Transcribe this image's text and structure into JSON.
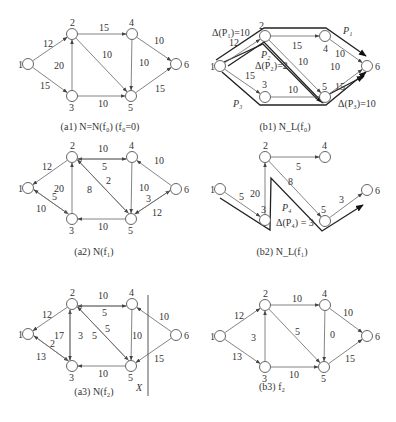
{
  "figure": {
    "node_radius": 5.5,
    "colors": {
      "edge": "#666666",
      "path": "#222222",
      "node_stroke": "#555555",
      "text": "#333333"
    },
    "panels": [
      {
        "id": "a1",
        "caption": "(a1)  N=N(f₀)   (f₀=0)",
        "caption_pos": [
          100,
          130
        ],
        "nodes": [
          {
            "id": "1",
            "x": 28,
            "y": 64,
            "lx": -10,
            "ly": 4
          },
          {
            "id": "2",
            "x": 72,
            "y": 34,
            "lx": -2,
            "ly": -8
          },
          {
            "id": "3",
            "x": 72,
            "y": 96,
            "lx": -3,
            "ly": 15
          },
          {
            "id": "4",
            "x": 132,
            "y": 34,
            "lx": -3,
            "ly": -8
          },
          {
            "id": "5",
            "x": 131,
            "y": 96,
            "lx": -3,
            "ly": 15
          },
          {
            "id": "6",
            "x": 176,
            "y": 64,
            "lx": 8,
            "ly": 4
          }
        ],
        "edges": [
          {
            "from": "1",
            "to": "2",
            "label": "12",
            "lx": 43,
            "ly": 47
          },
          {
            "from": "1",
            "to": "3",
            "label": "15",
            "lx": 40,
            "ly": 89
          },
          {
            "from": "3",
            "to": "2",
            "label": "20",
            "lx": 54,
            "ly": 69
          },
          {
            "from": "2",
            "to": "4",
            "label": "15",
            "lx": 99,
            "ly": 31
          },
          {
            "from": "2",
            "to": "5",
            "label": "10",
            "lx": 102,
            "ly": 58
          },
          {
            "from": "3",
            "to": "5",
            "label": "10",
            "lx": 98,
            "ly": 107
          },
          {
            "from": "4",
            "to": "5",
            "label": "10",
            "lx": 139,
            "ly": 66
          },
          {
            "from": "4",
            "to": "6",
            "label": "10",
            "lx": 154,
            "ly": 44
          },
          {
            "from": "5",
            "to": "6",
            "label": "15",
            "lx": 155,
            "ly": 92
          }
        ]
      },
      {
        "id": "b1",
        "caption": "(b1)  N_L(f₀)",
        "caption_pos": [
          285,
          130
        ],
        "nodes": [
          {
            "id": "1",
            "x": 220,
            "y": 66,
            "lx": -10,
            "ly": 4
          },
          {
            "id": "2",
            "x": 265,
            "y": 36,
            "lx": -6,
            "ly": -7
          },
          {
            "id": "3",
            "x": 265,
            "y": 97,
            "lx": -3,
            "ly": -9
          },
          {
            "id": "4",
            "x": 325,
            "y": 36,
            "lx": -2,
            "ly": 16
          },
          {
            "id": "5",
            "x": 325,
            "y": 97,
            "lx": -3,
            "ly": -7
          },
          {
            "id": "6",
            "x": 367,
            "y": 66,
            "lx": 8,
            "ly": 4
          }
        ],
        "edges": [
          {
            "from": "1",
            "to": "2",
            "label": "12",
            "lx": 229,
            "ly": 46
          },
          {
            "from": "1",
            "to": "3",
            "label": "15",
            "lx": 245,
            "ly": 79
          },
          {
            "from": "2",
            "to": "4",
            "label": "15",
            "lx": 292,
            "ly": 49
          },
          {
            "from": "2",
            "to": "5",
            "label": "10",
            "lx": 298,
            "ly": 65
          },
          {
            "from": "3",
            "to": "5",
            "label": "10",
            "lx": 288,
            "ly": 93
          },
          {
            "from": "4",
            "to": "6",
            "label": "10",
            "lx": 335,
            "ly": 57
          },
          {
            "from": "5",
            "to": "6",
            "label": "15",
            "lx": 335,
            "ly": 90
          }
        ],
        "annotations": [
          {
            "text": "Δ(P₁)=10",
            "x": 212,
            "y": 36
          },
          {
            "text": "P₁",
            "x": 343,
            "y": 34,
            "italic": true,
            "size": 13
          },
          {
            "text": "P₂",
            "x": 261,
            "y": 58,
            "italic": true,
            "size": 11
          },
          {
            "text": "Δ(P₂)=2",
            "x": 255,
            "y": 69
          },
          {
            "text": "10",
            "x": 330,
            "y": 70
          },
          {
            "text": "P₃",
            "x": 233,
            "y": 107,
            "italic": true,
            "size": 11
          },
          {
            "text": "Δ(P₃)=10",
            "x": 338,
            "y": 107
          }
        ],
        "augmenting_paths": [
          {
            "name": "P1",
            "points": [
              [
                216,
                60
              ],
              [
                264,
                28
              ],
              [
                326,
                28
              ],
              [
                366,
                56
              ]
            ]
          },
          {
            "name": "P2",
            "points": [
              [
                224,
                62
              ],
              [
                263,
                44
              ],
              [
                318,
                100
              ],
              [
                364,
                76
              ]
            ]
          },
          {
            "name": "P3",
            "points": [
              [
                222,
                72
              ],
              [
                260,
                105
              ],
              [
                326,
                105
              ],
              [
                366,
                72
              ]
            ]
          },
          {
            "name": "P2b",
            "points": [
              [
                228,
                66
              ],
              [
                264,
                42
              ],
              [
                323,
                103
              ]
            ]
          }
        ]
      },
      {
        "id": "a2",
        "caption": "(a2)  N(f₁)",
        "caption_pos": [
          94,
          255
        ],
        "nodes": [
          {
            "id": "1",
            "x": 28,
            "y": 188,
            "lx": -10,
            "ly": 4
          },
          {
            "id": "2",
            "x": 72,
            "y": 157,
            "lx": -2,
            "ly": -8
          },
          {
            "id": "3",
            "x": 72,
            "y": 219,
            "lx": -3,
            "ly": 15
          },
          {
            "id": "4",
            "x": 132,
            "y": 157,
            "lx": -3,
            "ly": -8
          },
          {
            "id": "5",
            "x": 131,
            "y": 219,
            "lx": -3,
            "ly": 15
          },
          {
            "id": "6",
            "x": 176,
            "y": 189,
            "lx": 8,
            "ly": 4
          }
        ],
        "edges": [
          {
            "from": "2",
            "to": "1",
            "label": "12",
            "lx": 42,
            "ly": 170
          },
          {
            "from": "1",
            "to": "3",
            "label": "5",
            "lx": 52,
            "ly": 200,
            "offset": -2
          },
          {
            "from": "3",
            "to": "1",
            "label": "10",
            "lx": 36,
            "ly": 212,
            "offset": 2
          },
          {
            "from": "3",
            "to": "2",
            "label": "20",
            "lx": 54,
            "ly": 192
          },
          {
            "from": "4",
            "to": "2",
            "label": "10",
            "lx": 98,
            "ly": 152,
            "offset": -2
          },
          {
            "from": "2",
            "to": "4",
            "label": "5",
            "lx": 102,
            "ly": 170,
            "offset": 2
          },
          {
            "from": "2",
            "to": "5",
            "label": "2",
            "lx": 106,
            "ly": 184,
            "offset": -2
          },
          {
            "from": "5",
            "to": "2",
            "label": "8",
            "lx": 87,
            "ly": 193,
            "offset": 2
          },
          {
            "from": "5",
            "to": "3",
            "label": "10",
            "lx": 98,
            "ly": 230
          },
          {
            "from": "4",
            "to": "5",
            "label": "10",
            "lx": 139,
            "ly": 191
          },
          {
            "from": "6",
            "to": "4",
            "label": "10",
            "lx": 154,
            "ly": 164
          },
          {
            "from": "5",
            "to": "6",
            "label": "3",
            "lx": 146,
            "ly": 202,
            "offset": -2
          },
          {
            "from": "6",
            "to": "5",
            "label": "12",
            "lx": 152,
            "ly": 216,
            "offset": 2
          }
        ]
      },
      {
        "id": "b2",
        "caption": "(b2)  N_L(f₁)",
        "caption_pos": [
          282,
          255
        ],
        "nodes": [
          {
            "id": "1",
            "x": 220,
            "y": 189,
            "lx": -10,
            "ly": 4
          },
          {
            "id": "2",
            "x": 265,
            "y": 157,
            "lx": -2,
            "ly": -8
          },
          {
            "id": "3",
            "x": 265,
            "y": 220,
            "lx": -4,
            "ly": -7
          },
          {
            "id": "4",
            "x": 325,
            "y": 157,
            "lx": -3,
            "ly": -8
          },
          {
            "id": "5",
            "x": 325,
            "y": 221,
            "lx": -4,
            "ly": -8
          },
          {
            "id": "6",
            "x": 367,
            "y": 190,
            "lx": 8,
            "ly": 4
          }
        ],
        "edges": [
          {
            "from": "1",
            "to": "3",
            "label": "5",
            "lx": 239,
            "ly": 200
          },
          {
            "from": "3",
            "to": "2",
            "label": "20",
            "lx": 250,
            "ly": 197
          },
          {
            "from": "2",
            "to": "4",
            "label": "5",
            "lx": 296,
            "ly": 170
          },
          {
            "from": "2",
            "to": "5",
            "label": "8",
            "lx": 288,
            "ly": 185
          },
          {
            "from": "5",
            "to": "6",
            "label": "3",
            "lx": 339,
            "ly": 203
          }
        ],
        "annotations": [
          {
            "text": "P₄",
            "x": 282,
            "y": 211,
            "italic": true,
            "size": 11
          },
          {
            "text": "Δ(P₄) = 3",
            "x": 276,
            "y": 226
          }
        ],
        "augmenting_paths": [
          {
            "name": "P4",
            "points": [
              [
                220,
                198
              ],
              [
                270,
                230
              ],
              [
                271,
                178
              ],
              [
                322,
                231
              ],
              [
                363,
                205
              ]
            ]
          }
        ]
      },
      {
        "id": "a3",
        "caption": "(a3)  N(f₂)",
        "caption_pos": [
          94,
          395
        ],
        "nodes": [
          {
            "id": "1",
            "x": 28,
            "y": 334,
            "lx": -10,
            "ly": 4
          },
          {
            "id": "2",
            "x": 72,
            "y": 304,
            "lx": -2,
            "ly": -8
          },
          {
            "id": "3",
            "x": 72,
            "y": 366,
            "lx": -3,
            "ly": 15
          },
          {
            "id": "4",
            "x": 132,
            "y": 304,
            "lx": -3,
            "ly": -8
          },
          {
            "id": "5",
            "x": 131,
            "y": 366,
            "lx": -3,
            "ly": 15
          },
          {
            "id": "6",
            "x": 176,
            "y": 335,
            "lx": 8,
            "ly": 4
          }
        ],
        "edges": [
          {
            "from": "2",
            "to": "1",
            "label": "12",
            "lx": 42,
            "ly": 318
          },
          {
            "from": "1",
            "to": "3",
            "label": "2",
            "lx": 50,
            "ly": 347,
            "offset": -2
          },
          {
            "from": "3",
            "to": "1",
            "label": "13",
            "lx": 36,
            "ly": 360,
            "offset": 2
          },
          {
            "from": "3",
            "to": "2",
            "label": "17",
            "lx": 54,
            "ly": 339,
            "offset": -2
          },
          {
            "from": "2",
            "to": "3",
            "label": "3",
            "lx": 78,
            "ly": 339,
            "offset": 2
          },
          {
            "from": "4",
            "to": "2",
            "label": "10",
            "lx": 98,
            "ly": 299,
            "offset": -2
          },
          {
            "from": "2",
            "to": "4",
            "label": "5",
            "lx": 102,
            "ly": 316,
            "offset": 2
          },
          {
            "from": "2",
            "to": "5",
            "label": "5",
            "lx": 105,
            "ly": 332,
            "offset": -2
          },
          {
            "from": "5",
            "to": "2",
            "label": "5",
            "lx": 92,
            "ly": 339,
            "offset": 2
          },
          {
            "from": "5",
            "to": "3",
            "label": "10",
            "lx": 98,
            "ly": 377
          },
          {
            "from": "4",
            "to": "5",
            "label": "10",
            "lx": 132,
            "ly": 339,
            "offset": 0
          },
          {
            "from": "6",
            "to": "4",
            "label": "10",
            "lx": 159,
            "ly": 320
          },
          {
            "from": "6",
            "to": "5",
            "label": "15",
            "lx": 154,
            "ly": 362
          }
        ],
        "cut": {
          "x": 148,
          "y1": 295,
          "y2": 396,
          "label": "X",
          "lx": 136,
          "ly": 391
        }
      },
      {
        "id": "b3",
        "caption": "(b3)  f₂",
        "caption_pos": [
          272,
          390
        ],
        "nodes": [
          {
            "id": "1",
            "x": 220,
            "y": 336,
            "lx": -10,
            "ly": 4
          },
          {
            "id": "2",
            "x": 265,
            "y": 305,
            "lx": -2,
            "ly": -8
          },
          {
            "id": "3",
            "x": 265,
            "y": 367,
            "lx": -3,
            "ly": 15
          },
          {
            "id": "4",
            "x": 325,
            "y": 305,
            "lx": -3,
            "ly": -8
          },
          {
            "id": "5",
            "x": 324,
            "y": 367,
            "lx": -3,
            "ly": 15
          },
          {
            "id": "6",
            "x": 367,
            "y": 336,
            "lx": 8,
            "ly": 4
          }
        ],
        "edges": [
          {
            "from": "1",
            "to": "2",
            "label": "12",
            "lx": 234,
            "ly": 319
          },
          {
            "from": "1",
            "to": "3",
            "label": "13",
            "lx": 232,
            "ly": 360
          },
          {
            "from": "3",
            "to": "2",
            "label": "3",
            "lx": 251,
            "ly": 341
          },
          {
            "from": "2",
            "to": "4",
            "label": "10",
            "lx": 292,
            "ly": 302
          },
          {
            "from": "2",
            "to": "5",
            "label": "5",
            "lx": 295,
            "ly": 335
          },
          {
            "from": "3",
            "to": "5",
            "label": "10",
            "lx": 289,
            "ly": 378
          },
          {
            "from": "4",
            "to": "5",
            "label": "0",
            "lx": 330,
            "ly": 338
          },
          {
            "from": "4",
            "to": "6",
            "label": "10",
            "lx": 343,
            "ly": 316
          },
          {
            "from": "5",
            "to": "6",
            "label": "15",
            "lx": 345,
            "ly": 362
          }
        ]
      }
    ]
  }
}
